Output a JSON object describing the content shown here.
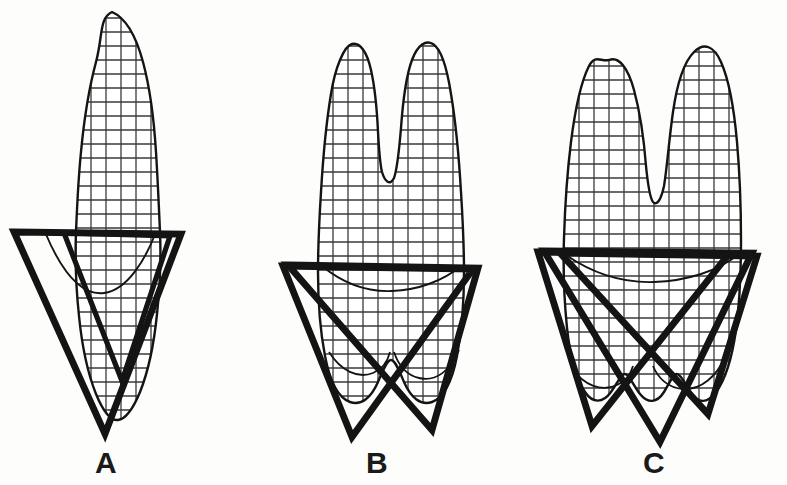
{
  "figure": {
    "background_color": "#fdfdfb",
    "ink_color": "#141414",
    "grid_color": "#3a3a3a",
    "panels": [
      {
        "id": "A",
        "label": "A",
        "tooth_type": "single-rooted anterior tooth",
        "cusp_count": 1,
        "root_count": 1,
        "triangle_count": 2,
        "grid_columns": 5,
        "grid_rows": 20
      },
      {
        "id": "B",
        "label": "B",
        "tooth_type": "two-cusped bifurcated tooth",
        "cusp_count": 2,
        "root_count": 2,
        "triangle_count": 2,
        "grid_columns": 9,
        "grid_rows": 20
      },
      {
        "id": "C",
        "label": "C",
        "tooth_type": "multi-cusped molar",
        "cusp_count": 2,
        "root_count": 3,
        "triangle_count": 3,
        "grid_columns": 11,
        "grid_rows": 20
      }
    ],
    "grid": {
      "cell_width_px": 15,
      "cell_height_px": 14,
      "stroke_width_px": 1.3
    },
    "outline": {
      "stroke_width_px": 2.4
    },
    "triangle": {
      "stroke_width_px": 6.5,
      "orientation": "inverted"
    },
    "label_font_size_px": 30
  }
}
